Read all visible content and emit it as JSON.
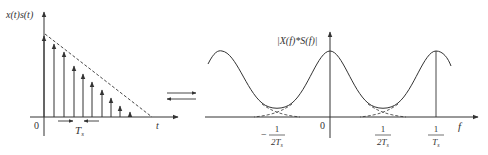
{
  "left_plot": {
    "ylabel": "x(t)s(t)",
    "xlabel": "t",
    "origin": "0",
    "interval_label_main": "T",
    "interval_label_sub": "s",
    "samples": [
      {
        "x": 44,
        "top": 36
      },
      {
        "x": 54,
        "top": 44
      },
      {
        "x": 64,
        "top": 52
      },
      {
        "x": 74,
        "top": 66
      },
      {
        "x": 83,
        "top": 74
      },
      {
        "x": 92,
        "top": 82
      },
      {
        "x": 102,
        "top": 90
      },
      {
        "x": 111,
        "top": 98
      },
      {
        "x": 120,
        "top": 106
      },
      {
        "x": 130,
        "top": 112
      }
    ]
  },
  "transform_arrows": {
    "forward": "→",
    "inverse": "←"
  },
  "right_plot": {
    "ylabel": "|X(f)*S(f)|",
    "xlabel": "f",
    "origin": "0",
    "ticks": [
      {
        "sign": "−",
        "num": "1",
        "den_main": "2T",
        "den_sub": "s",
        "x": 277
      },
      {
        "sign": "",
        "num": "1",
        "den_main": "2T",
        "den_sub": "s",
        "x": 383
      },
      {
        "sign": "",
        "num": "1",
        "den_main": "T",
        "den_sub": "s",
        "x": 436
      }
    ]
  }
}
